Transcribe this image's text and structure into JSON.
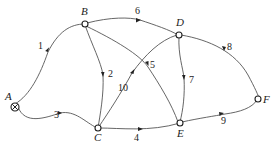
{
  "diagram": {
    "type": "directed-network",
    "nodes": [
      {
        "id": "A",
        "label": "A",
        "source": true
      },
      {
        "id": "B",
        "label": "B"
      },
      {
        "id": "C",
        "label": "C"
      },
      {
        "id": "D",
        "label": "D"
      },
      {
        "id": "E",
        "label": "E"
      },
      {
        "id": "F",
        "label": "F"
      }
    ],
    "edges": [
      {
        "from": "A",
        "to": "B",
        "label": "1"
      },
      {
        "from": "B",
        "to": "C",
        "label": "2"
      },
      {
        "from": "A",
        "to": "C",
        "label": "3"
      },
      {
        "from": "C",
        "to": "E",
        "label": "4"
      },
      {
        "from": "B",
        "to": "E",
        "label": "5"
      },
      {
        "from": "B",
        "to": "D",
        "label": "6"
      },
      {
        "from": "D",
        "to": "E",
        "label": "7"
      },
      {
        "from": "D",
        "to": "F",
        "label": "8"
      },
      {
        "from": "E",
        "to": "F",
        "label": "9"
      },
      {
        "from": "C",
        "to": "D",
        "label": "10"
      }
    ]
  }
}
